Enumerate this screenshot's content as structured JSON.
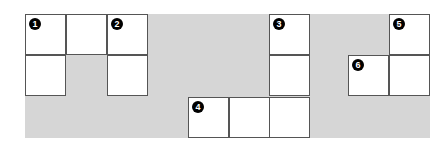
{
  "figure": {
    "background_band_color": "#d6d6d6",
    "cell_size": 41,
    "shapes": [
      {
        "label": "1",
        "cells": [
          [
            25,
            14
          ],
          [
            66,
            14
          ],
          [
            25,
            55
          ]
        ],
        "number_cell": [
          25,
          14
        ]
      },
      {
        "label": "2",
        "cells": [
          [
            107,
            14
          ],
          [
            107,
            55
          ]
        ],
        "number_cell": [
          107,
          14
        ]
      },
      {
        "label": "3",
        "cells": [
          [
            269,
            14
          ],
          [
            269,
            55
          ],
          [
            269,
            97
          ]
        ],
        "number_cell": [
          269,
          14
        ]
      },
      {
        "label": "4",
        "cells": [
          [
            188,
            97
          ],
          [
            229,
            97
          ]
        ],
        "number_cell": [
          188,
          97
        ]
      },
      {
        "label": "5",
        "cells": [
          [
            389,
            14
          ],
          [
            389,
            55
          ]
        ],
        "number_cell": [
          389,
          14
        ]
      },
      {
        "label": "6",
        "cells": [
          [
            348,
            55
          ]
        ],
        "number_cell": [
          348,
          55
        ]
      }
    ]
  }
}
